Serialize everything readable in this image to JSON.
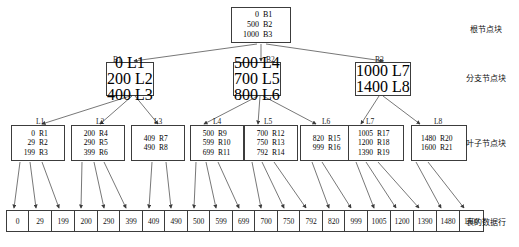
{
  "diagram": {
    "side_labels": [
      {
        "id": "root-level",
        "text": "根节点块"
      },
      {
        "id": "branch-level",
        "text": "分支节点块"
      },
      {
        "id": "leaf-level",
        "text": "叶子节点块"
      },
      {
        "id": "data-level",
        "text": "表的数据行"
      }
    ],
    "root": {
      "tag": "",
      "entries": [
        {
          "key": "0",
          "ptr": "B1"
        },
        {
          "key": "500",
          "ptr": "B2"
        },
        {
          "key": "1000",
          "ptr": "B3"
        }
      ]
    },
    "branches": [
      {
        "tag": "B1",
        "entries": [
          {
            "key": "0",
            "ptr": "L1"
          },
          {
            "key": "200",
            "ptr": "L2"
          },
          {
            "key": "400",
            "ptr": "L3"
          }
        ]
      },
      {
        "tag": "B2",
        "entries": [
          {
            "key": "500",
            "ptr": "L4"
          },
          {
            "key": "700",
            "ptr": "L5"
          },
          {
            "key": "800",
            "ptr": "L6"
          }
        ]
      },
      {
        "tag": "B3",
        "entries": [
          {
            "key": "1000",
            "ptr": "L7"
          },
          {
            "key": "1400",
            "ptr": "L8"
          }
        ]
      }
    ],
    "leaves": [
      {
        "tag": "L1",
        "entries": [
          {
            "key": "0",
            "ptr": "R1"
          },
          {
            "key": "29",
            "ptr": "R2"
          },
          {
            "key": "199",
            "ptr": "R3"
          }
        ]
      },
      {
        "tag": "L2",
        "entries": [
          {
            "key": "200",
            "ptr": "R4"
          },
          {
            "key": "290",
            "ptr": "R5"
          },
          {
            "key": "399",
            "ptr": "R6"
          }
        ]
      },
      {
        "tag": "L3",
        "entries": [
          {
            "key": "409",
            "ptr": "R7"
          },
          {
            "key": "490",
            "ptr": "R8"
          }
        ]
      },
      {
        "tag": "L4",
        "entries": [
          {
            "key": "500",
            "ptr": "R9"
          },
          {
            "key": "599",
            "ptr": "R10"
          },
          {
            "key": "699",
            "ptr": "R11"
          }
        ]
      },
      {
        "tag": "L5",
        "entries": [
          {
            "key": "700",
            "ptr": "R12"
          },
          {
            "key": "750",
            "ptr": "R13"
          },
          {
            "key": "792",
            "ptr": "R14"
          }
        ]
      },
      {
        "tag": "L6",
        "entries": [
          {
            "key": "820",
            "ptr": "R15"
          },
          {
            "key": "999",
            "ptr": "R16"
          }
        ]
      },
      {
        "tag": "L7",
        "entries": [
          {
            "key": "1005",
            "ptr": "R17"
          },
          {
            "key": "1200",
            "ptr": "R18"
          },
          {
            "key": "1390",
            "ptr": "R19"
          }
        ]
      },
      {
        "tag": "L8",
        "entries": [
          {
            "key": "1480",
            "ptr": "R20"
          },
          {
            "key": "1600",
            "ptr": "R21"
          }
        ]
      }
    ],
    "data_row": {
      "cells": [
        "0",
        "29",
        "199",
        "200",
        "290",
        "399",
        "409",
        "490",
        "500",
        "599",
        "699",
        "700",
        "750",
        "792",
        "820",
        "999",
        "1005",
        "1200",
        "1390",
        "1480",
        "1600"
      ]
    },
    "colors": {
      "stroke": "#3c3c3c",
      "text": "#111111",
      "background": "#ffffff"
    }
  }
}
